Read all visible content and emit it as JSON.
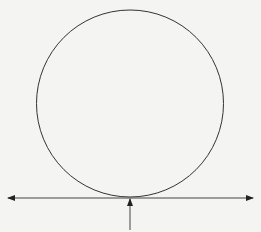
{
  "diagram": {
    "colors": {
      "background": "#f4f4f2",
      "stroke": "#333333"
    },
    "circle": {
      "cx": 130,
      "cy": 103.5,
      "r": 93.5
    },
    "horizontal_line": {
      "x1": 8,
      "x2": 253,
      "y": 198,
      "arrows": "both-ends"
    },
    "vertical_arrow": {
      "x": 130,
      "y_start": 230,
      "y_end": 199,
      "direction": "up"
    }
  }
}
